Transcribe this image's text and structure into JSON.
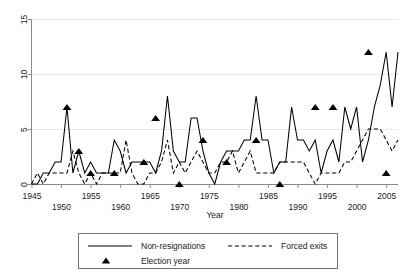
{
  "chart_data": {
    "type": "line",
    "title": "",
    "xlabel": "Year",
    "ylabel": "",
    "xlim": [
      1945,
      2007
    ],
    "ylim": [
      0,
      15
    ],
    "grid": "horizontal",
    "legend_position": "bottom",
    "yticks": [
      0,
      5,
      10,
      15
    ],
    "ytick_labels": [
      "0",
      "5",
      "10",
      "15"
    ],
    "xticks": [
      1945,
      1950,
      1955,
      1960,
      1965,
      1970,
      1975,
      1980,
      1985,
      1990,
      1995,
      2000,
      2005
    ],
    "xtick_labels": [
      "1945",
      "1950",
      "1955",
      "1960",
      "1965",
      "1970",
      "1975",
      "1980",
      "1985",
      "1990",
      "1995",
      "2000",
      "2005"
    ],
    "x": [
      1945,
      1946,
      1947,
      1948,
      1949,
      1950,
      1951,
      1952,
      1953,
      1954,
      1955,
      1956,
      1957,
      1958,
      1959,
      1960,
      1961,
      1962,
      1963,
      1964,
      1965,
      1966,
      1967,
      1968,
      1969,
      1970,
      1971,
      1972,
      1973,
      1974,
      1975,
      1976,
      1977,
      1978,
      1979,
      1980,
      1981,
      1982,
      1983,
      1984,
      1985,
      1986,
      1987,
      1988,
      1989,
      1990,
      1991,
      1992,
      1993,
      1994,
      1995,
      1996,
      1997,
      1998,
      1999,
      2000,
      2001,
      2002,
      2003,
      2004,
      2005,
      2006,
      2007
    ],
    "series": [
      {
        "name": "Non-resignations",
        "style": "solid",
        "values": [
          0,
          0,
          1,
          1,
          2,
          2,
          7,
          1,
          3,
          1,
          2,
          1,
          1,
          1,
          4,
          3,
          1,
          2,
          2,
          2,
          2,
          1,
          3,
          8,
          3,
          2,
          2,
          6,
          6,
          3,
          1,
          0,
          2,
          3,
          3,
          3,
          4,
          4,
          8,
          4,
          4,
          1,
          2,
          2,
          7,
          4,
          4,
          3,
          4,
          1,
          3,
          4,
          2,
          7,
          5,
          7,
          2,
          4,
          7,
          9,
          12,
          7,
          12
        ]
      },
      {
        "name": "Forced exits",
        "style": "dashed",
        "values": [
          0,
          1,
          0,
          1,
          1,
          1,
          1,
          3,
          1,
          0,
          1,
          0,
          1,
          1,
          1,
          1,
          4,
          1,
          0,
          0,
          1,
          1,
          2,
          4,
          1,
          2,
          1,
          2,
          3,
          2,
          1,
          1,
          2,
          2,
          3,
          1,
          2,
          3,
          1,
          1,
          1,
          1,
          2,
          2,
          2,
          2,
          2,
          1,
          0,
          1,
          1,
          1,
          1,
          2,
          2,
          3,
          4,
          5,
          5,
          5,
          4,
          3,
          4
        ]
      }
    ],
    "markers": {
      "name": "Election year",
      "shape": "triangle",
      "points": [
        {
          "x": 1951,
          "y": 7
        },
        {
          "x": 1953,
          "y": 3
        },
        {
          "x": 1955,
          "y": 1
        },
        {
          "x": 1959,
          "y": 1
        },
        {
          "x": 1964,
          "y": 2
        },
        {
          "x": 1966,
          "y": 6
        },
        {
          "x": 1970,
          "y": 0
        },
        {
          "x": 1974,
          "y": 4
        },
        {
          "x": 1978,
          "y": 2
        },
        {
          "x": 1983,
          "y": 4
        },
        {
          "x": 1987,
          "y": 0
        },
        {
          "x": 1993,
          "y": 7
        },
        {
          "x": 1996,
          "y": 7
        },
        {
          "x": 2002,
          "y": 12
        },
        {
          "x": 2005,
          "y": 1
        }
      ]
    },
    "axis_title_color": "#1a1a1a",
    "series_color": "#000000",
    "grid_color": "#e9e9e9",
    "background": "#ffffff"
  },
  "legend": {
    "entries": [
      {
        "key": "non-resignations",
        "label": "Non-resignations",
        "style": "solid"
      },
      {
        "key": "forced-exits",
        "label": "Forced exits",
        "style": "dashed"
      },
      {
        "key": "election-year",
        "label": "Election year",
        "style": "triangle"
      }
    ]
  },
  "axes": {
    "x_title": "Year",
    "y_title": ""
  }
}
